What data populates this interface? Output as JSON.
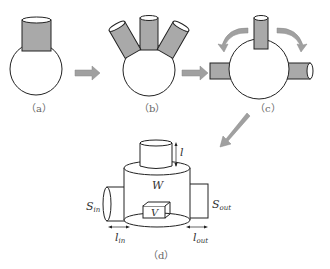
{
  "panels": {
    "a": {
      "label": "（a）"
    },
    "b": {
      "label": "（b）"
    },
    "c": {
      "label": "（c）"
    },
    "d": {
      "label": "（d）"
    }
  },
  "symbols": {
    "l": "l",
    "W": "W",
    "V": "V",
    "S_in": "S",
    "S_in_sub": "in",
    "S_out": "S",
    "S_out_sub": "out",
    "l_in": "l",
    "l_in_sub": "in",
    "l_out": "l",
    "l_out_sub": "out"
  },
  "colors": {
    "neck_fill": "#a9a9a9",
    "arrow_fill": "#a0a0a0",
    "stroke": "#222222"
  }
}
